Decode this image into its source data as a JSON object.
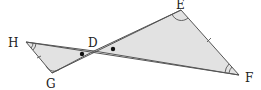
{
  "diagram": {
    "title": "",
    "colors": {
      "fill": "#e2e2e2",
      "stroke": "#555555",
      "label": "#222222",
      "background": "#ffffff"
    },
    "points": {
      "H": {
        "label": "H",
        "x": 26,
        "y": 42,
        "label_x": 8,
        "label_y": 47
      },
      "G": {
        "label": "G",
        "x": 52,
        "y": 73,
        "label_x": 46,
        "label_y": 88
      },
      "D": {
        "label": "D",
        "x": 94,
        "y": 51,
        "label_x": 88,
        "label_y": 47
      },
      "E": {
        "label": "E",
        "x": 181,
        "y": 10,
        "label_x": 176,
        "label_y": 8
      },
      "F": {
        "label": "F",
        "x": 239,
        "y": 75,
        "label_x": 245,
        "label_y": 82
      }
    },
    "triangles": [
      {
        "name": "triangle-DGH",
        "vertices": [
          "H",
          "G",
          "D"
        ]
      },
      {
        "name": "triangle-DEF",
        "vertices": [
          "D",
          "E",
          "F"
        ]
      }
    ],
    "markings": {
      "vertical_angle_dots": [
        "angle HDG",
        "angle EDF"
      ],
      "single_arcs": [
        "G",
        "E"
      ],
      "double_arcs": [
        "H",
        "F"
      ],
      "tick_marks": [
        "HG",
        "EF"
      ]
    }
  }
}
